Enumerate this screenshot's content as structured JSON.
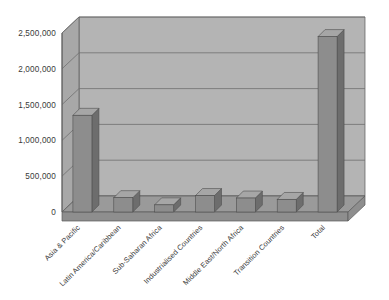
{
  "chart_data": {
    "type": "bar",
    "title": "",
    "subtitle": "",
    "xlabel": "",
    "ylabel": "",
    "ylim": [
      0,
      2500000
    ],
    "grid": true,
    "legend": false,
    "legend_position": "none",
    "style": "3d-column",
    "categories": [
      "Asia & Pacific",
      "Latin America/Caribbean",
      "Sub-Saharan Africa",
      "Industrialised Countries",
      "Middle East/North Africa",
      "Transition Countries",
      "Total"
    ],
    "values": [
      1350000,
      200000,
      100000,
      230000,
      195000,
      175000,
      2450000
    ],
    "ytick_labels": [
      "0",
      "500,000",
      "1,000,000",
      "1,500,000",
      "2,000,000",
      "2,500,000"
    ],
    "ytick_values": [
      0,
      500000,
      1000000,
      1500000,
      2000000,
      2500000
    ]
  },
  "colors": {
    "background": "#ffffff",
    "wall_back": "#b4b4b4",
    "wall_side": "#a8a8a8",
    "floor_top": "#9a9a9a",
    "floor_front": "#8e8e8e",
    "bar_front": "#8d8d8d",
    "bar_side": "#6d6d6d",
    "bar_top": "#a6a6a6",
    "gridline": "#707070",
    "axis_line": "#5a5a5a",
    "text": "#3a3a3a"
  },
  "geometry": {
    "plot_left": 62,
    "plot_right": 348,
    "plot_bottom": 212,
    "plot_top": 33,
    "depth_x": 17,
    "depth_y": -16,
    "bar_width": 19,
    "bar_depth_x": 7,
    "bar_depth_y": -7,
    "label_rotation_deg": -45
  }
}
